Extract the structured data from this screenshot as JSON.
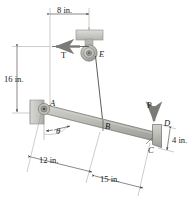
{
  "figure": {
    "type": "engineering-free-body-diagram",
    "background_color": "#ffffff",
    "line_color": "#3a3a3a",
    "member_fill": "#b9b9b4",
    "member_edge": "#6d6d68",
    "wall_fill": "#c9c9c5",
    "pulley_fill": "#bdbdb8"
  },
  "dimensions": [
    {
      "id": "top",
      "label": "8 in.",
      "orientation": "horizontal",
      "note": "horizontal offset from A to pulley E"
    },
    {
      "id": "left",
      "label": "16 in.",
      "orientation": "vertical",
      "note": "vertical height from A level to pulley E level"
    },
    {
      "id": "lower_left",
      "label": "12 in.",
      "orientation": "along-member",
      "note": "distance A to B along lever"
    },
    {
      "id": "lower_right",
      "label": "15 in.",
      "orientation": "along-member",
      "note": "distance B to C along lever"
    },
    {
      "id": "right",
      "label": "4 in.",
      "orientation": "along-flange",
      "note": "length of end flange D to C"
    }
  ],
  "points": [
    {
      "id": "A",
      "label": "A",
      "note": "pin support at wall bracket"
    },
    {
      "id": "B",
      "label": "B",
      "note": "cable attachment point on lever"
    },
    {
      "id": "C",
      "label": "C",
      "note": "lower end of bent flange"
    },
    {
      "id": "D",
      "label": "D",
      "note": "upper corner of bent flange, load applied"
    },
    {
      "id": "E",
      "label": "E",
      "note": "pulley center"
    }
  ],
  "forces": [
    {
      "id": "T",
      "label": "T",
      "direction": "left",
      "note": "cable tension leaving pulley horizontally"
    },
    {
      "id": "P",
      "label": "P",
      "direction": "down",
      "note": "applied load at D"
    }
  ],
  "angles": [
    {
      "id": "theta",
      "label": "θ",
      "note": "angle of lever AB measured from vertical reference at A"
    }
  ]
}
